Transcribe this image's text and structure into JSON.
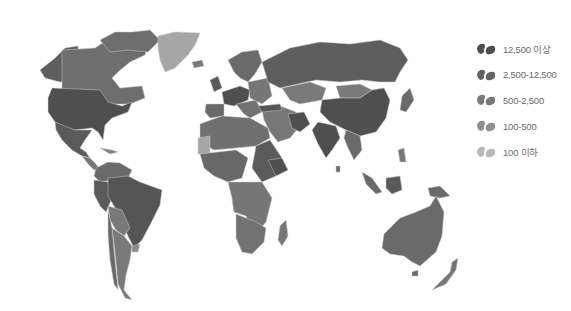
{
  "map": {
    "title": "",
    "type": "choropleth-world",
    "palette": {
      "level1": "#4f4f4f",
      "level2": "#5f5f5f",
      "level3": "#727272",
      "level4": "#868686",
      "level5": "#a6a6a6",
      "border": "#c9c9c9",
      "background": "#ffffff"
    }
  },
  "legend": {
    "items": [
      {
        "label": "12,500 이상",
        "color": "#4f4f4f"
      },
      {
        "label": "2,500-12,500",
        "color": "#5f5f5f"
      },
      {
        "label": "500-2,500",
        "color": "#727272"
      },
      {
        "label": "100-500",
        "color": "#868686"
      },
      {
        "label": "100 이하",
        "color": "#a6a6a6"
      }
    ]
  }
}
